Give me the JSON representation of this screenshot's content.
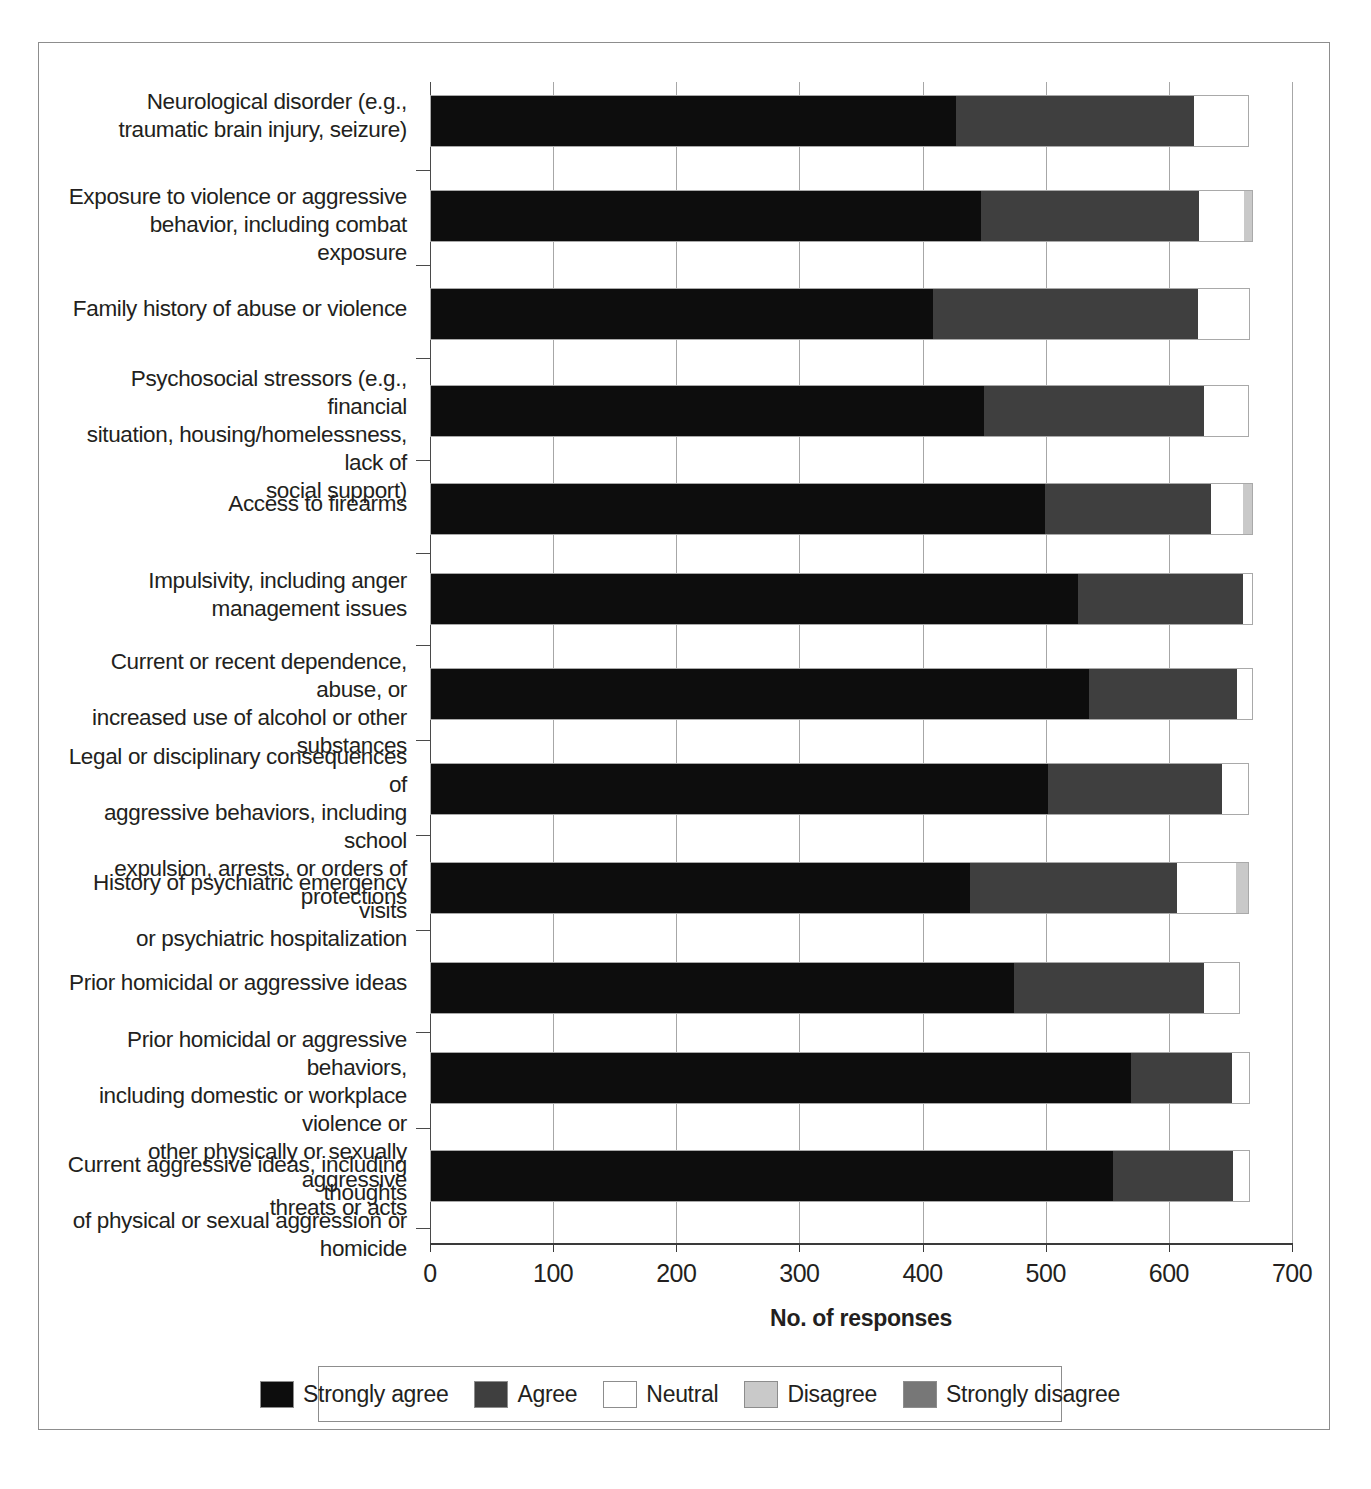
{
  "figure": {
    "title": "",
    "x_axis_title": "No. of responses"
  },
  "legend": {
    "items": [
      {
        "label": "Strongly agree",
        "color": "#0d0d0d"
      },
      {
        "label": "Agree",
        "color": "#3f3f3f"
      },
      {
        "label": "Neutral",
        "color": "#ffffff"
      },
      {
        "label": "Disagree",
        "color": "#c9c9c9"
      },
      {
        "label": "Strongly disagree",
        "color": "#777777"
      }
    ]
  },
  "axis": {
    "ticks": [
      "0",
      "100",
      "200",
      "300",
      "400",
      "500",
      "600",
      "700"
    ]
  },
  "categories": [
    "Neurological disorder (e.g.,\ntraumatic brain injury, seizure)",
    "Exposure to violence or aggressive\nbehavior, including combat exposure",
    "Family history of abuse or violence",
    "Psychosocial stressors (e.g., financial\nsituation, housing/homelessness, lack of\nsocial support)",
    "Access to firearms",
    "Impulsivity, including anger\nmanagement issues",
    "Current or recent dependence, abuse, or\nincreased use of alcohol or other substances",
    "Legal or disciplinary consequences of\naggressive behaviors, including school\nexpulsion, arrests, or orders of protections",
    "History of psychiatric emergency visits\nor psychiatric hospitalization",
    "Prior homicidal or aggressive ideas",
    "Prior homicidal or aggressive behaviors,\nincluding domestic or workplace violence or\nother physically or sexually aggressive\nthreats or acts",
    "Current aggressive ideas, including thoughts\nof physical or sexual aggression or homicide"
  ],
  "chart_data": {
    "type": "bar",
    "orientation": "horizontal",
    "stacked": true,
    "title": "",
    "xlabel": "No. of responses",
    "ylabel": "",
    "xlim": [
      0,
      700
    ],
    "xticks": [
      0,
      100,
      200,
      300,
      400,
      500,
      600,
      700
    ],
    "grid": "vertical",
    "legend_position": "bottom",
    "categories": [
      "Neurological disorder (e.g., traumatic brain injury, seizure)",
      "Exposure to violence or aggressive behavior, including combat exposure",
      "Family history of abuse or violence",
      "Psychosocial stressors (e.g., financial situation, housing/homelessness, lack of social support)",
      "Access to firearms",
      "Impulsivity, including anger management issues",
      "Current or recent dependence, abuse, or increased use of alcohol or other substances",
      "Legal or disciplinary consequences of aggressive behaviors, including school expulsion, arrests, or orders of protections",
      "History of psychiatric emergency visits or psychiatric hospitalization",
      "Prior homicidal or aggressive ideas",
      "Prior homicidal or aggressive behaviors, including domestic or workplace violence or other physically or sexually aggressive threats or acts",
      "Current aggressive ideas, including thoughts of physical or sexual aggression or homicide"
    ],
    "series": [
      {
        "name": "Strongly agree",
        "color": "#0d0d0d",
        "values": [
          427,
          448,
          409,
          450,
          500,
          527,
          536,
          502,
          439,
          475,
          570,
          555
        ]
      },
      {
        "name": "Agree",
        "color": "#3f3f3f",
        "values": [
          194,
          177,
          215,
          179,
          135,
          134,
          120,
          142,
          168,
          154,
          82,
          98
        ]
      },
      {
        "name": "Neutral",
        "color": "#ffffff",
        "values": [
          44,
          37,
          42,
          36,
          26,
          7,
          12,
          21,
          48,
          29,
          14,
          13
        ]
      },
      {
        "name": "Disagree",
        "color": "#c9c9c9",
        "values": [
          0,
          6,
          0,
          0,
          7,
          0,
          0,
          0,
          10,
          0,
          0,
          0
        ]
      },
      {
        "name": "Strongly disagree",
        "color": "#777777",
        "values": [
          0,
          0,
          0,
          0,
          0,
          0,
          0,
          0,
          0,
          0,
          0,
          0
        ]
      }
    ],
    "totals": [
      665,
      668,
      666,
      665,
      668,
      668,
      668,
      665,
      665,
      658,
      666,
      666
    ]
  },
  "layout": {
    "plot_left_px": 430,
    "plot_right_px": 1292,
    "rows": [
      {
        "bar_top": 95,
        "label_top": 88,
        "tick_top": 170
      },
      {
        "bar_top": 190,
        "label_top": 183,
        "tick_top": 265
      },
      {
        "bar_top": 288,
        "label_top": 295,
        "tick_top": 358
      },
      {
        "bar_top": 385,
        "label_top": 365,
        "tick_top": 460
      },
      {
        "bar_top": 483,
        "label_top": 490,
        "tick_top": 553
      },
      {
        "bar_top": 573,
        "label_top": 567,
        "tick_top": 645
      },
      {
        "bar_top": 668,
        "label_top": 648,
        "tick_top": 740
      },
      {
        "bar_top": 763,
        "label_top": 743,
        "tick_top": 835
      },
      {
        "bar_top": 862,
        "label_top": 869,
        "tick_top": 930
      },
      {
        "bar_top": 962,
        "label_top": 969,
        "tick_top": 1032
      },
      {
        "bar_top": 1052,
        "label_top": 1026,
        "tick_top": 1128
      },
      {
        "bar_top": 1150,
        "label_top": 1151,
        "tick_top": 1228
      }
    ]
  }
}
